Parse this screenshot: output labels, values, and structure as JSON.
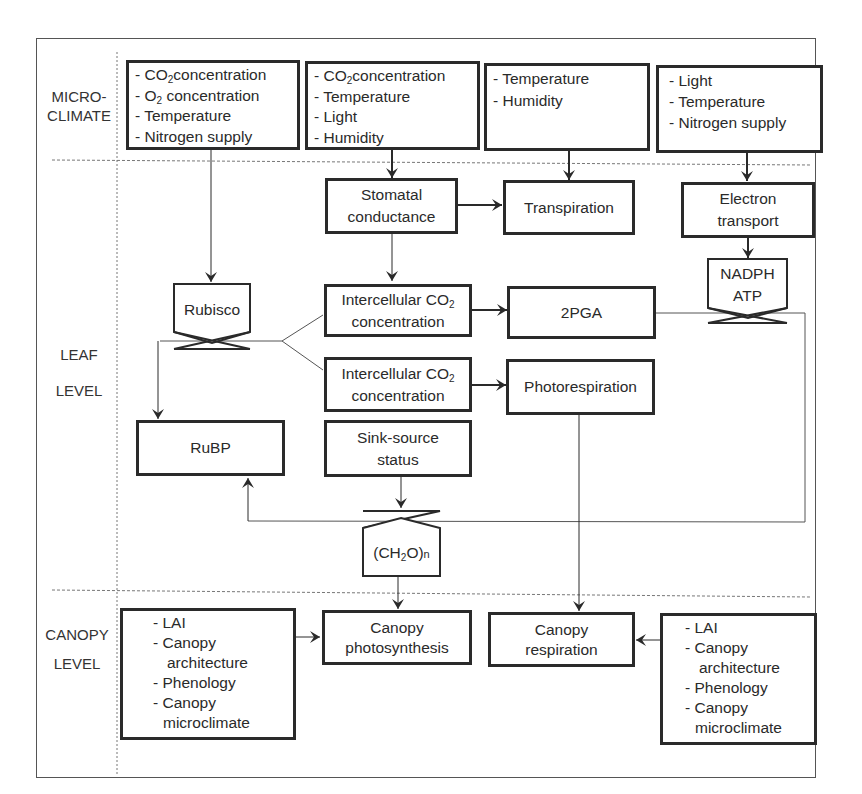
{
  "levels": {
    "micro": [
      "MICRO-",
      "CLIMATE"
    ],
    "leaf": [
      "LEAF",
      "LEVEL"
    ],
    "canopy": [
      "CANOPY",
      "LEVEL"
    ]
  },
  "microclimate_boxes": [
    {
      "items": [
        "- CO2concentration",
        "- O2 concentration",
        "- Temperature",
        "- Nitrogen supply"
      ]
    },
    {
      "items": [
        "- CO2concentration",
        "- Temperature",
        "- Light",
        "- Humidity"
      ]
    },
    {
      "items": [
        "- Temperature",
        "- Humidity"
      ]
    },
    {
      "items": [
        "- Light",
        "- Temperature",
        "- Nitrogen supply"
      ]
    }
  ],
  "leaf": {
    "stomatal": [
      "Stomatal",
      "conductance"
    ],
    "transpiration": "Transpiration",
    "electron": [
      "Electron",
      "transport"
    ],
    "nadph_atp": [
      "NADPH",
      "ATP"
    ],
    "rubisco": "Rubisco",
    "intercellular_1": [
      "Intercellular CO",
      "2",
      "concentration"
    ],
    "intercellular_2": [
      "Intercellular CO",
      "2",
      "concentration"
    ],
    "pga": "2PGA",
    "photorespiration": "Photorespiration",
    "rubp": "RuBP",
    "sink_source": [
      "Sink-source",
      "status"
    ],
    "ch2o": [
      "(CH",
      "2",
      "O)",
      "n"
    ]
  },
  "canopy": {
    "left_factors": [
      "- LAI",
      "- Canopy",
      "architecture",
      "- Phenology",
      "- Canopy",
      "microclimate"
    ],
    "photosynthesis": [
      "Canopy",
      "photosynthesis"
    ],
    "respiration": [
      "Canopy",
      "respiration"
    ],
    "right_factors": [
      "- LAI",
      "- Canopy",
      "architecture",
      "- Phenology",
      "- Canopy",
      "microclimate"
    ]
  },
  "colors": {
    "line": "#2a2a2a",
    "frame": "#555555",
    "divider": "#777777"
  }
}
